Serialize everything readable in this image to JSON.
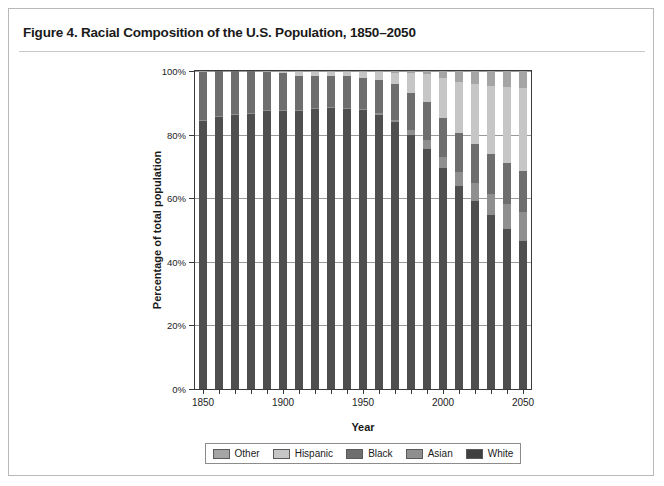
{
  "figure": {
    "title": "Figure 4. Racial Composition of the U.S. Population, 1850–2050"
  },
  "legend": {
    "position": "bottom",
    "items": [
      {
        "label": "Other",
        "key": "other",
        "color": "#a5a5a5"
      },
      {
        "label": "Hispanic",
        "key": "hispanic",
        "color": "#c6c6c6"
      },
      {
        "label": "Black",
        "key": "black",
        "color": "#6e6e6e"
      },
      {
        "label": "Asian",
        "key": "asian",
        "color": "#8f8f8f"
      },
      {
        "label": "White",
        "key": "white",
        "color": "#3f3f3f"
      }
    ]
  },
  "chart_data": {
    "type": "bar",
    "stacked": true,
    "stack_order_bottom_to_top": [
      "White",
      "Asian",
      "Black",
      "Hispanic",
      "Other"
    ],
    "title": "Figure 4. Racial Composition of the U.S. Population, 1850–2050",
    "xlabel": "Year",
    "ylabel": "Percentage of total population",
    "ylim": [
      0,
      100
    ],
    "yticks": [
      0,
      20,
      40,
      60,
      80,
      100
    ],
    "ytick_labels": [
      "0%",
      "20%",
      "40%",
      "60%",
      "80%",
      "100%"
    ],
    "grid": true,
    "xlim": [
      1845,
      2055
    ],
    "xtick_values": [
      1850,
      1860,
      1870,
      1880,
      1890,
      1900,
      1910,
      1920,
      1930,
      1940,
      1950,
      1960,
      1970,
      1980,
      1990,
      2000,
      2010,
      2020,
      2030,
      2040,
      2050
    ],
    "xtick_labels_shown": [
      "1850",
      "1900",
      "1950",
      "2000",
      "2050"
    ],
    "xtick_labels_shown_at": [
      1850,
      1900,
      1950,
      2000,
      2050
    ],
    "categories": [
      1850,
      1860,
      1870,
      1880,
      1890,
      1900,
      1910,
      1920,
      1930,
      1940,
      1950,
      1960,
      1970,
      1980,
      1990,
      2000,
      2010,
      2020,
      2030,
      2040,
      2050
    ],
    "series": [
      {
        "name": "White",
        "color": "#4f4f4f",
        "values": [
          84.3,
          85.5,
          86.2,
          86.6,
          87.5,
          87.4,
          87.4,
          88.1,
          88.3,
          88.2,
          87.6,
          86.2,
          84.0,
          80.0,
          75.6,
          69.4,
          63.7,
          59.1,
          54.6,
          50.3,
          46.5
        ]
      },
      {
        "name": "Asian",
        "color": "#8f8f8f",
        "values": [
          0.3,
          0.3,
          0.3,
          0.3,
          0.3,
          0.3,
          0.3,
          0.3,
          0.3,
          0.3,
          0.3,
          0.5,
          0.7,
          1.5,
          2.8,
          3.7,
          4.7,
          5.6,
          6.7,
          7.9,
          9.2
        ]
      },
      {
        "name": "Black",
        "color": "#6e6e6e",
        "values": [
          15.2,
          14.1,
          13.4,
          13.0,
          11.9,
          11.6,
          10.7,
          9.9,
          9.7,
          9.8,
          10.0,
          10.5,
          11.1,
          11.5,
          11.8,
          12.2,
          12.2,
          12.4,
          12.6,
          12.8,
          13.0
        ]
      },
      {
        "name": "Hispanic",
        "color": "#c6c6c6",
        "values": [
          0.0,
          0.0,
          0.0,
          0.0,
          0.0,
          0.5,
          1.2,
          1.4,
          1.4,
          1.4,
          1.8,
          2.4,
          3.7,
          6.4,
          9.0,
          12.5,
          16.0,
          18.9,
          21.5,
          24.0,
          26.1
        ]
      },
      {
        "name": "Other",
        "color": "#a5a5a5",
        "values": [
          0.2,
          0.1,
          0.1,
          0.1,
          0.3,
          0.2,
          0.4,
          0.3,
          0.3,
          0.3,
          0.3,
          0.4,
          0.5,
          0.6,
          0.8,
          2.2,
          3.4,
          4.0,
          4.6,
          5.0,
          5.2
        ]
      }
    ]
  }
}
